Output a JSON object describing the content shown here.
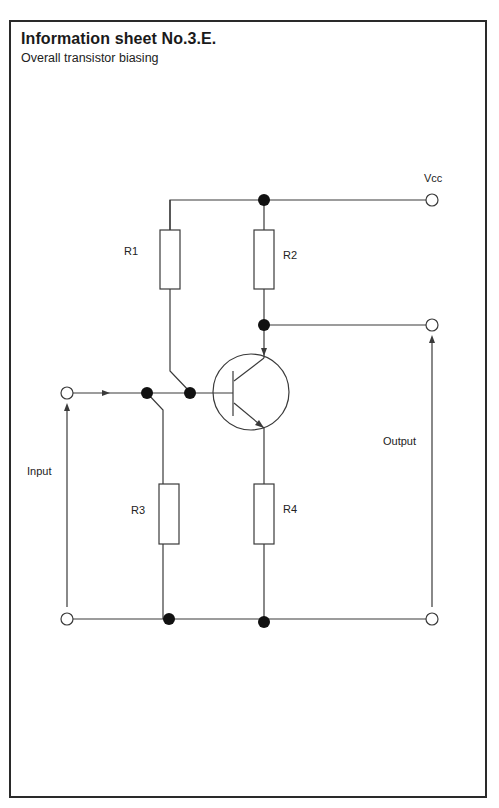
{
  "header": {
    "title": "Information sheet No.3.E.",
    "subtitle": "Overall transistor biasing"
  },
  "diagram": {
    "type": "circuit schematic",
    "labels": {
      "vcc": "Vcc",
      "r1": "R1",
      "r2": "R2",
      "r3": "R3",
      "r4": "R4",
      "input": "Input",
      "output": "Output"
    },
    "components": [
      {
        "id": "R1",
        "type": "resistor",
        "connects": [
          "Vcc rail",
          "base node"
        ]
      },
      {
        "id": "R2",
        "type": "resistor",
        "connects": [
          "Vcc rail",
          "collector"
        ]
      },
      {
        "id": "R3",
        "type": "resistor",
        "connects": [
          "base node",
          "ground rail"
        ]
      },
      {
        "id": "R4",
        "type": "resistor",
        "connects": [
          "emitter",
          "ground rail"
        ]
      },
      {
        "id": "Q1",
        "type": "npn-transistor"
      }
    ],
    "terminals": [
      "Vcc",
      "Input",
      "Output",
      "Input ground",
      "Output ground"
    ],
    "line_color": "#3a3a3a",
    "junction_color": "#111111"
  }
}
